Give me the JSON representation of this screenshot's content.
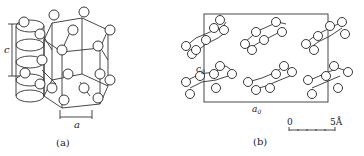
{
  "figure": {
    "panel_a": {
      "label": "(a)",
      "axis_c": "c",
      "axis_a": "a",
      "description": "hexagonal helical chain crystal structure"
    },
    "panel_b": {
      "label": "(b)",
      "axis_c": "c",
      "axis_c_sub": "0",
      "axis_a": "a",
      "axis_a_sub": "0",
      "scale_bar": {
        "start": "0",
        "end": "5Å"
      },
      "description": "unit cell projection with molecular rings"
    }
  }
}
